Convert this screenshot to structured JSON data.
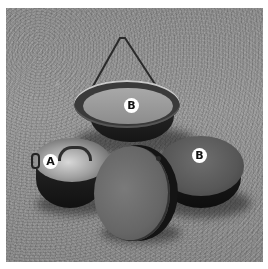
{
  "image": {
    "description": "Black and white photograph of cast-iron camp cooking pots on grass",
    "style": "grayscale"
  },
  "labels": [
    {
      "id": "top-pot",
      "text": "B"
    },
    {
      "id": "left-pot",
      "text": "A"
    },
    {
      "id": "right-pot",
      "text": "B"
    }
  ],
  "colors": {
    "label_bg": "#ffffff",
    "label_text": "#111111",
    "border": "#ffffff"
  }
}
